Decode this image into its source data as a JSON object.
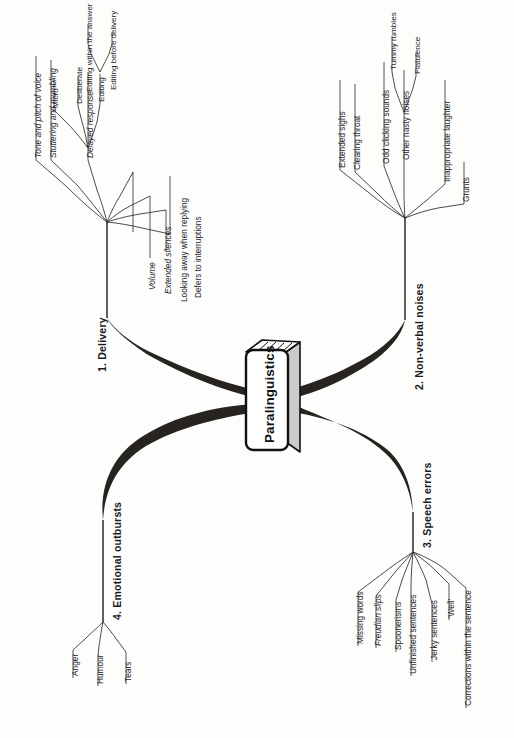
{
  "document": {
    "title": "Paralinguistics",
    "type": "mind-map",
    "orientation": "rotated-90-ccw",
    "background_color": "#fdfdfc",
    "ink_color": "#1c1c1c"
  },
  "center": {
    "label": "Paralinguistics",
    "shape": "3d-box",
    "fill": "#ffffff",
    "stroke": "#111111",
    "shade": "#c9c9c9"
  },
  "branches": [
    {
      "id": "branch-1",
      "label": "1.  Delivery",
      "number": "1.",
      "name": "Delivery",
      "children": [
        {
          "label": "Tone and pitch of voice",
          "style": "italic"
        },
        {
          "label": "Stuttering and mumbling",
          "style": "italic"
        },
        {
          "label": "Delayed response",
          "style": "italic",
          "children": [
            {
              "label": "Micro",
              "style": "normal"
            },
            {
              "label": "Deliberate",
              "style": "normal"
            },
            {
              "label": "Editing",
              "style": "normal",
              "children": [
                {
                  "label": "Editing within the answer",
                  "style": "normal"
                },
                {
                  "label": "Editing before delivery",
                  "style": "normal"
                }
              ]
            }
          ]
        },
        {
          "label": "Volume",
          "style": "italic"
        },
        {
          "label": "Extended silences",
          "style": "italic"
        },
        {
          "label": "Looking away when replying",
          "style": "normal"
        },
        {
          "label": "Defers to interruptions",
          "style": "normal"
        }
      ]
    },
    {
      "id": "branch-2",
      "label": "2.  Non-verbal noises",
      "number": "2.",
      "name": "Non-verbal noises",
      "children": [
        {
          "label": "Extended sighs",
          "style": "normal"
        },
        {
          "label": "Clearing throat",
          "style": "normal"
        },
        {
          "label": "Odd clicking sounds",
          "style": "normal"
        },
        {
          "label": "Other nasty noises",
          "style": "normal",
          "children": [
            {
              "label": "Tummy rumbles",
              "style": "normal"
            },
            {
              "label": "Flatulence",
              "style": "normal"
            }
          ]
        },
        {
          "label": "Inappropriate laughter",
          "style": "normal"
        },
        {
          "label": "Grunts",
          "style": "normal"
        }
      ]
    },
    {
      "id": "branch-3",
      "label": "3.  Speech errors",
      "number": "3.",
      "name": "Speech errors",
      "children": [
        {
          "label": "Missing words",
          "style": "normal"
        },
        {
          "label": "Freudian slips",
          "style": "italic"
        },
        {
          "label": "Spoonerisms",
          "style": "normal"
        },
        {
          "label": "Unfinished sentences",
          "style": "normal"
        },
        {
          "label": "Jerky sentences",
          "style": "normal"
        },
        {
          "label": "'Well'",
          "style": "normal"
        },
        {
          "label": "Corrections within the sentence",
          "style": "normal"
        }
      ]
    },
    {
      "id": "branch-4",
      "label": "4.  Emotional outbursts",
      "number": "4.",
      "name": "Emotional outbursts",
      "children": [
        {
          "label": "Anger",
          "style": "normal"
        },
        {
          "label": "Humour",
          "style": "normal"
        },
        {
          "label": "Tears",
          "style": "normal"
        }
      ]
    }
  ]
}
